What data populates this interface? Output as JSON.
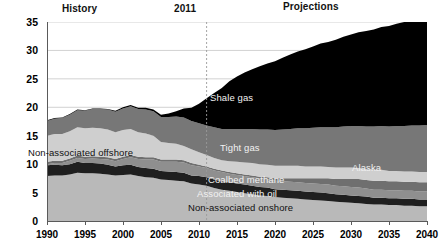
{
  "chart_data": {
    "type": "area",
    "stacked": true,
    "title": "",
    "xlabel": "",
    "ylabel": "",
    "xlim": [
      1990,
      2040
    ],
    "ylim": [
      0,
      35
    ],
    "grid": true,
    "legend_position": "in-plot-annotations",
    "x_ticks": [
      "1990",
      "1995",
      "2000",
      "2005",
      "2010",
      "2015",
      "2020",
      "2025",
      "2030",
      "2035",
      "2040"
    ],
    "y_ticks": [
      "0",
      "5",
      "10",
      "15",
      "20",
      "25",
      "30",
      "35"
    ],
    "annotations": {
      "history": "History",
      "divider_year": "2011",
      "projections": "Projections"
    },
    "x": [
      1990,
      1991,
      1992,
      1993,
      1994,
      1995,
      1996,
      1997,
      1998,
      1999,
      2000,
      2001,
      2002,
      2003,
      2004,
      2005,
      2006,
      2007,
      2008,
      2009,
      2010,
      2011,
      2012,
      2013,
      2014,
      2015,
      2016,
      2017,
      2018,
      2019,
      2020,
      2021,
      2022,
      2023,
      2024,
      2025,
      2026,
      2027,
      2028,
      2029,
      2030,
      2031,
      2032,
      2033,
      2034,
      2035,
      2036,
      2037,
      2038,
      2039,
      2040
    ],
    "series": [
      {
        "name": "Non-associated onshore",
        "color": "#b9b9b9",
        "values": [
          7.9,
          8.0,
          8.0,
          8.2,
          8.5,
          8.4,
          8.4,
          8.3,
          8.2,
          8.0,
          8.1,
          8.2,
          7.9,
          7.7,
          7.6,
          7.3,
          7.2,
          7.1,
          7.0,
          6.6,
          6.4,
          6.2,
          5.8,
          5.5,
          5.3,
          5.1,
          4.9,
          4.7,
          4.5,
          4.4,
          4.2,
          4.1,
          4.0,
          3.9,
          3.8,
          3.7,
          3.6,
          3.5,
          3.4,
          3.3,
          3.2,
          3.1,
          3.0,
          2.9,
          2.9,
          2.8,
          2.8,
          2.7,
          2.7,
          2.6,
          2.6
        ]
      },
      {
        "name": "Associated with oil",
        "color": "#1f1f1f",
        "values": [
          1.9,
          1.9,
          1.8,
          1.8,
          1.9,
          1.8,
          1.8,
          1.8,
          1.7,
          1.6,
          1.7,
          1.7,
          1.6,
          1.6,
          1.6,
          1.5,
          1.5,
          1.5,
          1.5,
          1.4,
          1.5,
          1.5,
          1.5,
          1.5,
          1.5,
          1.5,
          1.5,
          1.5,
          1.5,
          1.5,
          1.4,
          1.4,
          1.4,
          1.4,
          1.4,
          1.4,
          1.4,
          1.4,
          1.3,
          1.3,
          1.3,
          1.3,
          1.3,
          1.2,
          1.2,
          1.2,
          1.2,
          1.2,
          1.2,
          1.2,
          1.2
        ]
      },
      {
        "name": "Coalbed methane",
        "color": "#8f8f8f",
        "values": [
          0.2,
          0.3,
          0.4,
          0.6,
          0.7,
          0.7,
          0.8,
          0.8,
          0.9,
          0.9,
          1.1,
          1.3,
          1.4,
          1.5,
          1.6,
          1.6,
          1.7,
          1.8,
          1.8,
          1.8,
          1.7,
          1.6,
          1.6,
          1.6,
          1.5,
          1.5,
          1.5,
          1.5,
          1.5,
          1.5,
          1.5,
          1.5,
          1.5,
          1.5,
          1.5,
          1.5,
          1.5,
          1.5,
          1.5,
          1.5,
          1.5,
          1.5,
          1.4,
          1.4,
          1.4,
          1.4,
          1.4,
          1.4,
          1.4,
          1.4,
          1.4
        ]
      },
      {
        "name": "Alaska",
        "color": "#6f6f6f",
        "values": [
          0.4,
          0.4,
          0.4,
          0.4,
          0.4,
          0.4,
          0.4,
          0.4,
          0.4,
          0.4,
          0.4,
          0.4,
          0.4,
          0.4,
          0.4,
          0.4,
          0.4,
          0.4,
          0.4,
          0.4,
          0.3,
          0.3,
          0.3,
          0.3,
          0.3,
          0.3,
          0.3,
          0.3,
          0.3,
          0.3,
          0.4,
          0.5,
          0.6,
          0.7,
          0.8,
          0.9,
          1.0,
          1.1,
          1.2,
          1.3,
          1.4,
          1.5,
          1.5,
          1.6,
          1.6,
          1.6,
          1.6,
          1.6,
          1.6,
          1.6,
          1.6
        ]
      },
      {
        "name": "Non-associated offshore",
        "color": "#cfcfcf",
        "values": [
          4.6,
          4.7,
          4.7,
          4.8,
          5.0,
          5.0,
          5.0,
          5.0,
          4.9,
          4.7,
          4.7,
          4.6,
          4.3,
          4.2,
          3.8,
          3.1,
          2.9,
          2.8,
          2.5,
          2.4,
          2.2,
          2.0,
          1.9,
          1.8,
          1.9,
          2.0,
          2.1,
          2.2,
          2.2,
          2.2,
          2.2,
          2.2,
          2.2,
          2.2,
          2.1,
          2.1,
          2.1,
          2.0,
          2.0,
          2.0,
          2.0,
          1.9,
          1.9,
          1.9,
          1.9,
          1.8,
          1.8,
          1.8,
          1.8,
          1.8,
          1.8
        ]
      },
      {
        "name": "Tight gas",
        "color": "#777777",
        "values": [
          2.6,
          2.7,
          2.8,
          2.9,
          3.0,
          3.1,
          3.3,
          3.4,
          3.5,
          3.6,
          3.8,
          4.0,
          4.1,
          4.2,
          4.3,
          4.4,
          4.6,
          4.8,
          5.0,
          5.0,
          5.1,
          5.2,
          5.4,
          5.5,
          5.7,
          5.8,
          5.9,
          6.0,
          6.1,
          6.2,
          6.3,
          6.4,
          6.5,
          6.6,
          6.7,
          6.8,
          6.9,
          7.0,
          7.1,
          7.2,
          7.3,
          7.4,
          7.5,
          7.6,
          7.7,
          7.8,
          7.9,
          8.0,
          8.1,
          8.2,
          8.3
        ]
      },
      {
        "name": "Shale gas",
        "color": "#000000",
        "values": [
          0.1,
          0.1,
          0.1,
          0.1,
          0.1,
          0.1,
          0.1,
          0.1,
          0.1,
          0.2,
          0.2,
          0.2,
          0.2,
          0.3,
          0.3,
          0.4,
          0.6,
          0.9,
          1.6,
          2.3,
          3.4,
          4.8,
          6.0,
          7.2,
          8.4,
          9.2,
          9.9,
          10.5,
          11.1,
          11.6,
          12.1,
          12.6,
          13.1,
          13.5,
          13.9,
          14.3,
          14.7,
          15.0,
          15.4,
          15.8,
          16.1,
          16.5,
          16.8,
          17.1,
          17.4,
          17.7,
          18.0,
          18.3,
          18.5,
          18.8,
          19.0
        ]
      }
    ]
  },
  "axis": {
    "y_ticks": [
      "35",
      "30",
      "25",
      "20",
      "15",
      "10",
      "5",
      "0"
    ],
    "x_ticks": [
      "1990",
      "1995",
      "2000",
      "2005",
      "2010",
      "2015",
      "2020",
      "2025",
      "2030",
      "2035",
      "2040"
    ]
  },
  "header": {
    "history": "History",
    "divider_year": "2011",
    "projections": "Projections"
  },
  "series_labels": {
    "shale": "Shale gas",
    "tight": "Tight gas",
    "alaska": "Alaska",
    "coalbed": "Coalbed methane",
    "associated": "Associated with oil",
    "na_onshore": "Non-associated onshore",
    "na_offshore": "Non-associated offshore"
  },
  "colors": {
    "shale": "#000000",
    "tight": "#777777",
    "na_offshore": "#cfcfcf",
    "alaska": "#6f6f6f",
    "coalbed": "#8f8f8f",
    "associated": "#1f1f1f",
    "na_onshore": "#b9b9b9",
    "gridline": "#d2d2d2",
    "axis": "#5a5a5a",
    "divider": "#9a9a9a"
  }
}
